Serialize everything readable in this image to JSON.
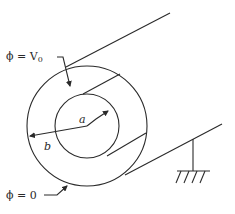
{
  "figure": {
    "labels": {
      "inner_potential": "ϕ = V",
      "inner_potential_sub": "0",
      "outer_potential": "ϕ = 0",
      "inner_radius": "a",
      "outer_radius": "b"
    },
    "colors": {
      "stroke": "#2a2a2a",
      "background": "#ffffff"
    }
  }
}
